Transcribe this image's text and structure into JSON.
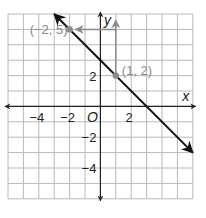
{
  "chart_data": {
    "type": "line",
    "title": "",
    "xlabel": "x",
    "ylabel": "y",
    "origin_label": "O",
    "xlim": [
      -6,
      6
    ],
    "ylim": [
      -6,
      6
    ],
    "grid": true,
    "x_tick_labels": [
      "−4",
      "−2",
      "2"
    ],
    "x_tick_values": [
      -4,
      -2,
      2
    ],
    "y_tick_labels": [
      "2",
      "−2",
      "−4"
    ],
    "y_tick_values": [
      2,
      -2,
      -4
    ],
    "series": [
      {
        "name": "line",
        "equation": "y = -x + 3",
        "x": [
          -3,
          6
        ],
        "y": [
          6,
          -3
        ],
        "color": "#111111",
        "arrows": "both"
      }
    ],
    "points": [
      {
        "label": "(−2, 5)",
        "x": -2,
        "y": 5,
        "color": "#8a8a8a"
      },
      {
        "label": "(1, 2)",
        "x": 1,
        "y": 2,
        "color": "#8a8a8a"
      }
    ],
    "annotations": [
      {
        "type": "arrow",
        "from": [
          1,
          2
        ],
        "to": [
          1,
          5.6
        ],
        "color": "#8a8a8a",
        "meaning": "rise 3"
      },
      {
        "type": "arrow",
        "from": [
          1,
          5
        ],
        "to": [
          -2,
          5
        ],
        "color": "#8a8a8a",
        "meaning": "run -3"
      }
    ]
  },
  "colors": {
    "grid": "#b8b8b8",
    "axis": "#222222",
    "line": "#111111",
    "annotation": "#8a8a8a"
  }
}
